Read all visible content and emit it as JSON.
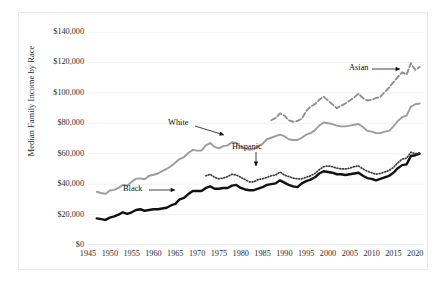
{
  "figure": {
    "watermark_left": "",
    "watermark_right": ""
  },
  "chart_data": {
    "type": "line",
    "title": "",
    "xlabel": "",
    "ylabel": "Median Family Income by Race",
    "xlim": [
      1945,
      2022
    ],
    "ylim": [
      0,
      140000
    ],
    "grid": true,
    "legend_position": "inline-annotations",
    "x_ticks": [
      1945,
      1950,
      1955,
      1960,
      1965,
      1970,
      1975,
      1980,
      1985,
      1990,
      1995,
      2000,
      2005,
      2010,
      2015,
      2020
    ],
    "x_tick_labels": [
      "1945",
      "1950",
      "1955",
      "1960",
      "1965",
      "1970",
      "1975",
      "1980",
      "1985",
      "1990",
      "1995",
      "2000",
      "2005",
      "2010",
      "2015",
      "2020"
    ],
    "y_ticks": [
      0,
      20000,
      40000,
      60000,
      80000,
      100000,
      120000,
      140000
    ],
    "y_tick_labels": [
      "$0",
      "$20,000",
      "$40,000",
      "$60,000",
      "$80,000",
      "$100,000",
      "$120,000",
      "$140,000"
    ],
    "annotations": [
      {
        "text": "White",
        "series": "White",
        "x": 1975,
        "y": 70000
      },
      {
        "text": "Black",
        "series": "Black",
        "x": 1964,
        "y": 38000
      },
      {
        "text": "Hispanic",
        "series": "Hispanic",
        "x": 1989,
        "y": 56000
      },
      {
        "text": "Asian",
        "series": "Asian",
        "x": 2014,
        "y": 107000
      }
    ],
    "series": [
      {
        "name": "White",
        "color": "#9c9c9c",
        "style": "solid",
        "width": 1.9,
        "x": [
          1947,
          1948,
          1949,
          1950,
          1951,
          1952,
          1953,
          1954,
          1955,
          1956,
          1957,
          1958,
          1959,
          1960,
          1961,
          1962,
          1963,
          1964,
          1965,
          1966,
          1967,
          1968,
          1969,
          1970,
          1971,
          1972,
          1973,
          1974,
          1975,
          1976,
          1977,
          1978,
          1979,
          1980,
          1981,
          1982,
          1983,
          1984,
          1985,
          1986,
          1987,
          1988,
          1989,
          1990,
          1991,
          1992,
          1993,
          1994,
          1995,
          1996,
          1997,
          1998,
          1999,
          2000,
          2001,
          2002,
          2003,
          2004,
          2005,
          2006,
          2007,
          2008,
          2009,
          2010,
          2011,
          2012,
          2013,
          2014,
          2015,
          2016,
          2017,
          2018,
          2019,
          2020,
          2021
        ],
        "values": [
          35000,
          34200,
          33600,
          35800,
          36200,
          37500,
          39500,
          39000,
          41500,
          43500,
          43800,
          43200,
          45500,
          46200,
          47000,
          48500,
          50000,
          51800,
          54000,
          56500,
          57800,
          60500,
          62500,
          62000,
          62000,
          65500,
          67000,
          64500,
          63500,
          65000,
          65500,
          67500,
          67000,
          64500,
          63500,
          62500,
          63000,
          65000,
          66500,
          69500,
          70500,
          71500,
          72500,
          71500,
          69500,
          69000,
          69000,
          70500,
          72500,
          73500,
          75500,
          78500,
          80500,
          80000,
          79500,
          78500,
          78000,
          78000,
          78500,
          79000,
          79500,
          77500,
          75000,
          74500,
          73500,
          73500,
          74500,
          75000,
          78000,
          81500,
          84000,
          85000,
          91000,
          92500,
          93000
        ]
      },
      {
        "name": "Black",
        "color": "#111111",
        "style": "solid",
        "width": 2.4,
        "x": [
          1947,
          1948,
          1949,
          1950,
          1951,
          1952,
          1953,
          1954,
          1955,
          1956,
          1957,
          1958,
          1959,
          1960,
          1961,
          1962,
          1963,
          1964,
          1965,
          1966,
          1967,
          1968,
          1969,
          1970,
          1971,
          1972,
          1973,
          1974,
          1975,
          1976,
          1977,
          1978,
          1979,
          1980,
          1981,
          1982,
          1983,
          1984,
          1985,
          1986,
          1987,
          1988,
          1989,
          1990,
          1991,
          1992,
          1993,
          1994,
          1995,
          1996,
          1997,
          1998,
          1999,
          2000,
          2001,
          2002,
          2003,
          2004,
          2005,
          2006,
          2007,
          2008,
          2009,
          2010,
          2011,
          2012,
          2013,
          2014,
          2015,
          2016,
          2017,
          2018,
          2019,
          2020,
          2021
        ],
        "values": [
          17500,
          17000,
          16500,
          18000,
          18800,
          20000,
          21500,
          20500,
          21500,
          23000,
          23500,
          22500,
          23000,
          23500,
          23500,
          24000,
          24500,
          26000,
          27000,
          30000,
          31000,
          33500,
          35500,
          35500,
          35500,
          37500,
          38500,
          37000,
          37000,
          37500,
          37500,
          39000,
          39500,
          37500,
          36500,
          36000,
          36000,
          37000,
          38000,
          39500,
          40000,
          40500,
          42500,
          41000,
          39500,
          38500,
          38000,
          40500,
          42000,
          43000,
          44500,
          47000,
          48500,
          48000,
          47500,
          46500,
          46500,
          46000,
          46500,
          47000,
          47500,
          45500,
          44000,
          43500,
          42500,
          43500,
          44500,
          45500,
          47500,
          50500,
          52500,
          53000,
          58500,
          59000,
          60000
        ]
      },
      {
        "name": "Hispanic",
        "color": "#3a3a3a",
        "style": "dotted",
        "width": 1.7,
        "x": [
          1972,
          1973,
          1974,
          1975,
          1976,
          1977,
          1978,
          1979,
          1980,
          1981,
          1982,
          1983,
          1984,
          1985,
          1986,
          1987,
          1988,
          1989,
          1990,
          1991,
          1992,
          1993,
          1994,
          1995,
          1996,
          1997,
          1998,
          1999,
          2000,
          2001,
          2002,
          2003,
          2004,
          2005,
          2006,
          2007,
          2008,
          2009,
          2010,
          2011,
          2012,
          2013,
          2014,
          2015,
          2016,
          2017,
          2018,
          2019,
          2020,
          2021
        ],
        "values": [
          45500,
          46500,
          44500,
          43500,
          44000,
          45000,
          46500,
          46000,
          44500,
          43000,
          41500,
          41500,
          43000,
          43500,
          44500,
          45500,
          46000,
          48000,
          46000,
          45000,
          44000,
          43500,
          43500,
          44500,
          45500,
          47000,
          49500,
          51500,
          52000,
          51500,
          50500,
          50000,
          50000,
          50500,
          51500,
          52000,
          50000,
          48500,
          47500,
          46500,
          47000,
          48000,
          49000,
          51000,
          54000,
          56500,
          57000,
          61000,
          60000,
          60500
        ]
      },
      {
        "name": "Asian",
        "color": "#8f8f8f",
        "style": "dashed",
        "width": 1.9,
        "x": [
          1987,
          1988,
          1989,
          1990,
          1991,
          1992,
          1993,
          1994,
          1995,
          1996,
          1997,
          1998,
          1999,
          2000,
          2001,
          2002,
          2003,
          2004,
          2005,
          2006,
          2007,
          2008,
          2009,
          2010,
          2011,
          2012,
          2013,
          2014,
          2015,
          2016,
          2017,
          2018,
          2019,
          2020,
          2021
        ],
        "values": [
          82000,
          83500,
          86500,
          85000,
          82000,
          81000,
          81500,
          83000,
          88000,
          91000,
          92500,
          95500,
          97500,
          95000,
          92500,
          90000,
          91500,
          93000,
          95000,
          97000,
          99500,
          96500,
          95000,
          95500,
          96500,
          97500,
          100500,
          103500,
          107000,
          110500,
          113500,
          112000,
          119500,
          115000,
          117000
        ]
      }
    ]
  }
}
